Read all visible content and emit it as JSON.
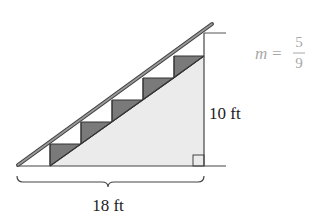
{
  "diagram": {
    "type": "staircase-slope",
    "labels": {
      "run": "18 ft",
      "rise": "10 ft",
      "slope_var": "m",
      "slope_eq": "=",
      "slope_num": "5",
      "slope_den": "9"
    },
    "steps": 5,
    "colors": {
      "line": "#333333",
      "rail_fill": "#888888",
      "step_fill": "#7a7a7a",
      "stair_body_fill": "#ebebeb",
      "slope_text": "#a8a8a8",
      "label_text": "#222222"
    }
  }
}
